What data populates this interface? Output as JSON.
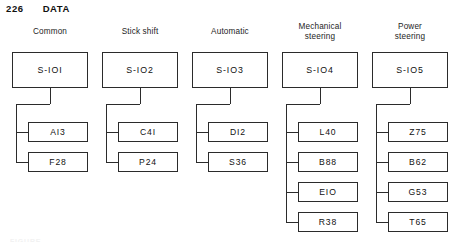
{
  "running_head": {
    "page_number": "226",
    "section": "DATA"
  },
  "figure": {
    "caption": "FIGURE",
    "columns": [
      {
        "title": "Common",
        "root": {
          "label": "S-IOI"
        },
        "children": [
          {
            "label": "AI3"
          },
          {
            "label": "F28"
          }
        ]
      },
      {
        "title": "Stick shift",
        "root": {
          "label": "S-IO2"
        },
        "children": [
          {
            "label": "C4I"
          },
          {
            "label": "P24"
          }
        ]
      },
      {
        "title": "Automatic",
        "root": {
          "label": "S-IO3"
        },
        "children": [
          {
            "label": "DI2"
          },
          {
            "label": "S36"
          }
        ]
      },
      {
        "title": "Mechanical\nsteering",
        "root": {
          "label": "S-IO4"
        },
        "children": [
          {
            "label": "L40"
          },
          {
            "label": "B88"
          },
          {
            "label": "EIO"
          },
          {
            "label": "R38"
          }
        ]
      },
      {
        "title": "Power\nsteering",
        "root": {
          "label": "S-IO5"
        },
        "children": [
          {
            "label": "Z75"
          },
          {
            "label": "B62"
          },
          {
            "label": "G53"
          },
          {
            "label": "T65"
          }
        ]
      }
    ]
  },
  "colors": {
    "ink": "#2b2b2b",
    "paper": "#ffffff"
  }
}
